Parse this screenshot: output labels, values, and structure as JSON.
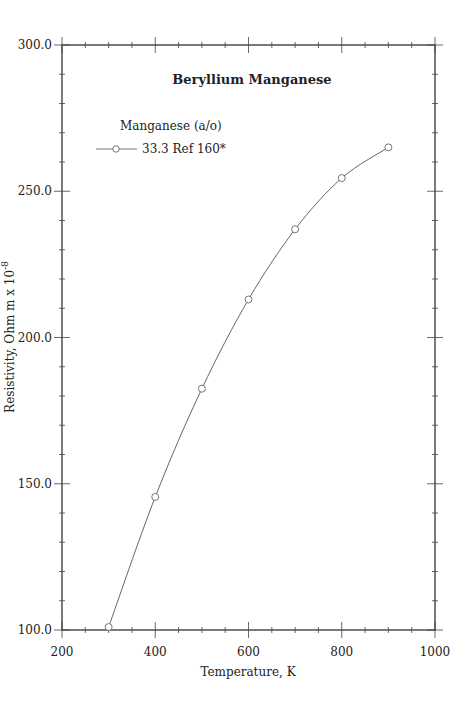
{
  "chart_data": {
    "type": "line",
    "title": "Beryllium  Manganese",
    "xlabel": "Temperature,  K",
    "ylabel": "Resistivity, Ohm m x 10",
    "ylabel_exponent": "-8",
    "xlim": [
      200,
      1000
    ],
    "ylim": [
      100,
      300
    ],
    "x_ticks": [
      "200",
      "400",
      "600",
      "800",
      "1000"
    ],
    "y_ticks": [
      "100.0",
      "150.0",
      "200.0",
      "250.0",
      "300.0"
    ],
    "grid": false,
    "legend": {
      "title": "Manganese (a/o)",
      "entries": [
        "33.3 Ref 160*"
      ],
      "position": "upper-left"
    },
    "series": [
      {
        "name": "33.3 Ref 160*",
        "marker": "open-circle",
        "x": [
          300,
          400,
          500,
          600,
          700,
          800,
          900
        ],
        "y": [
          101,
          145.5,
          182.5,
          213,
          237,
          254.5,
          265
        ]
      }
    ]
  }
}
